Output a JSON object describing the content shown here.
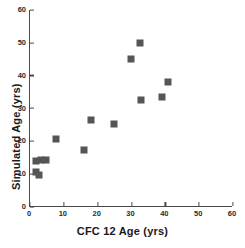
{
  "chart_data": {
    "type": "scatter",
    "title": "",
    "xlabel": "CFC 12 Age (yrs)",
    "ylabel": "Simulated Age (yrs)",
    "xlim": [
      0,
      60
    ],
    "ylim": [
      0,
      60
    ],
    "xticks": [
      0,
      10,
      20,
      30,
      40,
      50,
      60
    ],
    "yticks": [
      0,
      10,
      20,
      30,
      40,
      50,
      60
    ],
    "xtick_labels": [
      "0",
      "10",
      "20",
      "30",
      "40",
      "50",
      "60"
    ],
    "ytick_labels": [
      "0",
      "10",
      "20",
      "30",
      "40",
      "50",
      "60"
    ],
    "grid": false,
    "legend": false,
    "marker_shape": "square",
    "marker_color": "#555555",
    "axis_color": "#4a4a4a",
    "series": [
      {
        "name": "Samples",
        "points": [
          {
            "x": 2.0,
            "y": 14.0
          },
          {
            "x": 3.6,
            "y": 14.3
          },
          {
            "x": 5.0,
            "y": 14.2
          },
          {
            "x": 2.0,
            "y": 10.8
          },
          {
            "x": 3.0,
            "y": 9.8
          },
          {
            "x": 8.0,
            "y": 20.6
          },
          {
            "x": 16.3,
            "y": 17.3
          },
          {
            "x": 18.2,
            "y": 26.6
          },
          {
            "x": 25.2,
            "y": 25.3
          },
          {
            "x": 30.0,
            "y": 45.2
          },
          {
            "x": 32.7,
            "y": 49.8
          },
          {
            "x": 33.0,
            "y": 32.5
          },
          {
            "x": 39.2,
            "y": 33.4
          },
          {
            "x": 41.2,
            "y": 38.0
          }
        ]
      }
    ]
  }
}
